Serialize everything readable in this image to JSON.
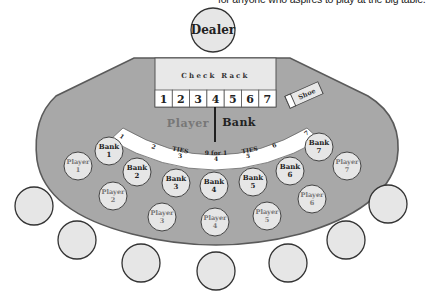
{
  "caption": "for anyone who aspires to play at the big table.",
  "dealer": {
    "label": "Dealer"
  },
  "check_rack": {
    "label": "Check Rack",
    "slots": [
      "1",
      "2",
      "3",
      "4",
      "5",
      "6",
      "7"
    ]
  },
  "shoe": {
    "label": "Shoe"
  },
  "layout": {
    "player_label": "Player",
    "bank_label": "Bank",
    "ties_band": {
      "numbers": [
        "1",
        "2",
        "3",
        "4",
        "5",
        "6",
        "7"
      ],
      "ties_left": "TIES",
      "ties_right": "TIES",
      "ties_center": "9 for 1"
    }
  },
  "bank_spots": [
    {
      "label": "Bank",
      "num": "1"
    },
    {
      "label": "Bank",
      "num": "2"
    },
    {
      "label": "Bank",
      "num": "3"
    },
    {
      "label": "Bank",
      "num": "4"
    },
    {
      "label": "Bank",
      "num": "5"
    },
    {
      "label": "Bank",
      "num": "6"
    },
    {
      "label": "Bank",
      "num": "7"
    }
  ],
  "player_spots": [
    {
      "label": "Player",
      "num": "1"
    },
    {
      "label": "Player",
      "num": "2"
    },
    {
      "label": "Player",
      "num": "3"
    },
    {
      "label": "Player",
      "num": "4"
    },
    {
      "label": "Player",
      "num": "5"
    },
    {
      "label": "Player",
      "num": "6"
    },
    {
      "label": "Player",
      "num": "7"
    }
  ],
  "seats": 7,
  "colors": {
    "felt": "#a8a8a8",
    "outline": "#555555",
    "spot_fill": "#e6e6e6",
    "rack_fill": "#e8e8e8",
    "player_text": "#777777",
    "bank_text": "#222222"
  }
}
